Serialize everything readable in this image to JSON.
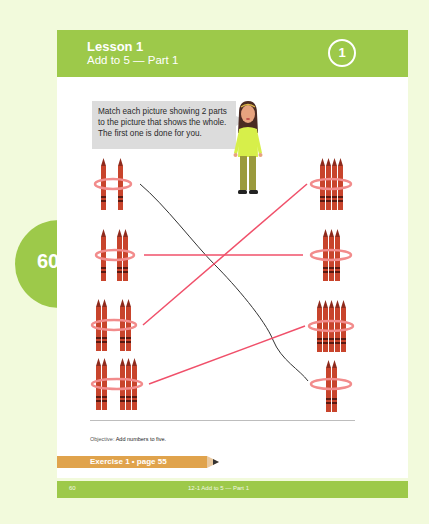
{
  "header": {
    "lesson": "Lesson 1",
    "subtitle": "Add to 5 — Part 1",
    "lesson_number": "1"
  },
  "side_tab": {
    "page_number": "60"
  },
  "instruction": {
    "line1": "Match each picture showing 2 parts",
    "line2": "to the picture that shows the whole.",
    "line3": "The first one is done for you."
  },
  "exercise": {
    "left_items": [
      {
        "parts": [
          1,
          1
        ],
        "total": 2
      },
      {
        "parts": [
          1,
          2
        ],
        "total": 3
      },
      {
        "parts": [
          2,
          2
        ],
        "total": 4
      },
      {
        "parts": [
          2,
          3
        ],
        "total": 5
      }
    ],
    "right_items": [
      {
        "count": 4
      },
      {
        "count": 3
      },
      {
        "count": 5
      },
      {
        "count": 2
      }
    ],
    "matches": [
      {
        "left": 0,
        "right": 3,
        "color": "#333333",
        "style": "example"
      },
      {
        "left": 1,
        "right": 1,
        "color": "#f0506a",
        "style": "answer"
      },
      {
        "left": 2,
        "right": 0,
        "color": "#f0506a",
        "style": "answer"
      },
      {
        "left": 3,
        "right": 2,
        "color": "#f0506a",
        "style": "answer"
      }
    ]
  },
  "objective": {
    "label": "Objective:",
    "text": "Add numbers to five."
  },
  "exercise_ref": "Exercise 1 • page 55",
  "footer": {
    "page": "60",
    "title": "12-1 Add to 5 — Part 1"
  },
  "colors": {
    "accent_green": "#9dc94a",
    "background": "#f2fadc",
    "crayon": "#c8442c",
    "ring": "#f28c8c",
    "answer_line": "#f0506a",
    "pencil": "#e0a34c"
  }
}
